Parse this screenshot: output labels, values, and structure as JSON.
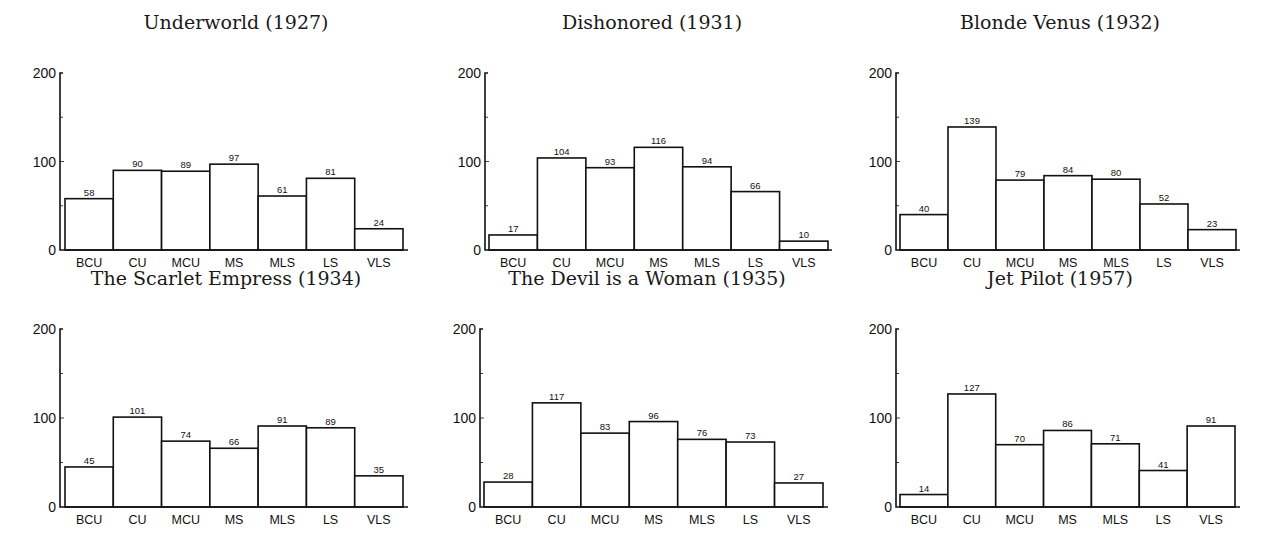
{
  "figure": {
    "categories": [
      "BCU",
      "CU",
      "MCU",
      "MS",
      "MLS",
      "LS",
      "VLS"
    ],
    "yticks": [
      "0",
      "100",
      "200"
    ]
  },
  "chart_data": [
    {
      "type": "bar",
      "title": "Underworld (1927)",
      "categories": [
        "BCU",
        "CU",
        "MCU",
        "MS",
        "MLS",
        "LS",
        "VLS"
      ],
      "values": [
        58,
        90,
        89,
        97,
        61,
        81,
        24
      ],
      "xlabel": "",
      "ylabel": "",
      "ylim": [
        0,
        200
      ],
      "yticks": [
        0,
        100,
        200
      ],
      "grid": false,
      "legend": null
    },
    {
      "type": "bar",
      "title": "Dishonored (1931)",
      "categories": [
        "BCU",
        "CU",
        "MCU",
        "MS",
        "MLS",
        "LS",
        "VLS"
      ],
      "values": [
        17,
        104,
        93,
        116,
        94,
        66,
        10
      ],
      "xlabel": "",
      "ylabel": "",
      "ylim": [
        0,
        200
      ],
      "yticks": [
        0,
        100,
        200
      ],
      "grid": false,
      "legend": null
    },
    {
      "type": "bar",
      "title": "Blonde Venus (1932)",
      "categories": [
        "BCU",
        "CU",
        "MCU",
        "MS",
        "MLS",
        "LS",
        "VLS"
      ],
      "values": [
        40,
        139,
        79,
        84,
        80,
        52,
        23
      ],
      "xlabel": "",
      "ylabel": "",
      "ylim": [
        0,
        200
      ],
      "yticks": [
        0,
        100,
        200
      ],
      "grid": false,
      "legend": null
    },
    {
      "type": "bar",
      "title": "The Scarlet Empress (1934)",
      "categories": [
        "BCU",
        "CU",
        "MCU",
        "MS",
        "MLS",
        "LS",
        "VLS"
      ],
      "values": [
        45,
        101,
        74,
        66,
        91,
        89,
        35
      ],
      "xlabel": "",
      "ylabel": "",
      "ylim": [
        0,
        200
      ],
      "yticks": [
        0,
        100,
        200
      ],
      "grid": false,
      "legend": null
    },
    {
      "type": "bar",
      "title": "The Devil is a Woman (1935)",
      "categories": [
        "BCU",
        "CU",
        "MCU",
        "MS",
        "MLS",
        "LS",
        "VLS"
      ],
      "values": [
        28,
        117,
        83,
        96,
        76,
        73,
        27
      ],
      "xlabel": "",
      "ylabel": "",
      "ylim": [
        0,
        200
      ],
      "yticks": [
        0,
        100,
        200
      ],
      "grid": false,
      "legend": null
    },
    {
      "type": "bar",
      "title": "Jet Pilot (1957)",
      "categories": [
        "BCU",
        "CU",
        "MCU",
        "MS",
        "MLS",
        "LS",
        "VLS"
      ],
      "values": [
        14,
        127,
        70,
        86,
        71,
        41,
        91
      ],
      "xlabel": "",
      "ylabel": "",
      "ylim": [
        0,
        200
      ],
      "yticks": [
        0,
        100,
        200
      ],
      "grid": false,
      "legend": null
    }
  ],
  "colors": {
    "bar_fill": "#ffffff",
    "bar_stroke": "#111111",
    "background": "#ffffff"
  }
}
